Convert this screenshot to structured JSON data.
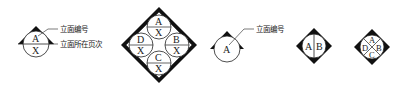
{
  "symbols": [
    {
      "id": "elevation-index-single-with-page",
      "letters": [
        "A",
        "X"
      ],
      "annotations": {
        "elevation_number": "立面编号",
        "elevation_page": "立面所在页次"
      }
    },
    {
      "id": "elevation-index-four-way-with-pages",
      "quadrants": [
        {
          "pos": "top",
          "letter": "A",
          "page": "X"
        },
        {
          "pos": "right",
          "letter": "B",
          "page": "X"
        },
        {
          "pos": "bottom",
          "letter": "C",
          "page": "X"
        },
        {
          "pos": "left",
          "letter": "D",
          "page": "X"
        }
      ]
    },
    {
      "id": "elevation-index-single",
      "letter": "A",
      "annotations": {
        "elevation_number": "立面编号"
      }
    },
    {
      "id": "elevation-index-two-way",
      "letters": [
        "A",
        "B"
      ]
    },
    {
      "id": "elevation-index-four-way",
      "letters": {
        "top": "A",
        "right": "B",
        "bottom": "C",
        "left": "D"
      }
    }
  ],
  "colors": {
    "stroke": "#222222",
    "fill": "#111111",
    "background": "#ffffff"
  }
}
